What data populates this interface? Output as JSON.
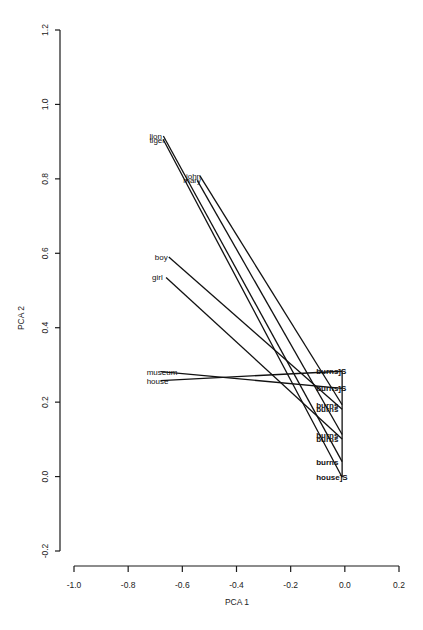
{
  "chart_data": {
    "type": "scatter",
    "title": "",
    "xlabel": "PCA 1",
    "ylabel": "PCA 2",
    "xlim": [
      -1.0,
      0.2
    ],
    "ylim": [
      -0.2,
      1.2
    ],
    "xticks": [
      "-1.0",
      "-0.8",
      "-0.6",
      "-0.4",
      "-0.2",
      "0.0",
      "0.2"
    ],
    "xtick_values": [
      -1.0,
      -0.8,
      -0.6,
      -0.4,
      -0.2,
      0.0,
      0.2
    ],
    "yticks": [
      "-0.2",
      "0.0",
      "0.2",
      "0.4",
      "0.6",
      "0.8",
      "1.0",
      "1.2"
    ],
    "ytick_values": [
      -0.2,
      0.0,
      0.2,
      0.4,
      0.6,
      0.8,
      1.0,
      1.2
    ],
    "grid": false,
    "legend": "none",
    "points": [
      {
        "label": "lion",
        "x": -0.67,
        "y": 0.915
      },
      {
        "label": "tiger",
        "x": -0.67,
        "y": 0.905
      },
      {
        "label": "john",
        "x": -0.535,
        "y": 0.808
      },
      {
        "label": "mary",
        "x": -0.545,
        "y": 0.796
      },
      {
        "label": "boy",
        "x": -0.65,
        "y": 0.59
      },
      {
        "label": "girl",
        "x": -0.66,
        "y": 0.535
      },
      {
        "label": "museum",
        "x": -0.68,
        "y": 0.282
      },
      {
        "label": "house",
        "x": -0.68,
        "y": 0.258
      },
      {
        "label": "burns]S",
        "x": -0.01,
        "y": 0.283
      },
      {
        "label": "burns]S",
        "x": -0.01,
        "y": 0.237
      },
      {
        "label": "burns",
        "x": -0.01,
        "y": 0.193
      },
      {
        "label": "burns",
        "x": -0.01,
        "y": 0.181
      },
      {
        "label": "burns",
        "x": -0.01,
        "y": 0.113
      },
      {
        "label": "burns",
        "x": -0.01,
        "y": 0.101
      },
      {
        "label": "burns",
        "x": -0.01,
        "y": 0.04
      },
      {
        "label": "house]S",
        "x": -0.01,
        "y": -0.002
      }
    ],
    "segments": [
      {
        "from": "lion",
        "to_index": 14,
        "x1": -0.67,
        "y1": 0.915,
        "x2": -0.01,
        "y2": 0.04
      },
      {
        "from": "tiger",
        "to_index": 15,
        "x1": -0.67,
        "y1": 0.905,
        "x2": -0.01,
        "y2": -0.002
      },
      {
        "from": "john",
        "to_index": 10,
        "x1": -0.535,
        "y1": 0.808,
        "x2": -0.01,
        "y2": 0.193
      },
      {
        "from": "mary",
        "to_index": 12,
        "x1": -0.545,
        "y1": 0.796,
        "x2": -0.01,
        "y2": 0.113
      },
      {
        "from": "boy",
        "to_index": 11,
        "x1": -0.65,
        "y1": 0.59,
        "x2": -0.01,
        "y2": 0.181
      },
      {
        "from": "girl",
        "to_index": 13,
        "x1": -0.66,
        "y1": 0.535,
        "x2": -0.01,
        "y2": 0.101
      },
      {
        "from": "museum",
        "to_index": 9,
        "x1": -0.68,
        "y1": 0.282,
        "x2": -0.01,
        "y2": 0.237
      },
      {
        "from": "house",
        "to_index": 8,
        "x1": -0.68,
        "y1": 0.258,
        "x2": -0.01,
        "y2": 0.283
      },
      {
        "from": "burns-top",
        "to_index": 15,
        "x1": -0.01,
        "y1": 0.283,
        "x2": -0.01,
        "y2": -0.002
      }
    ]
  }
}
